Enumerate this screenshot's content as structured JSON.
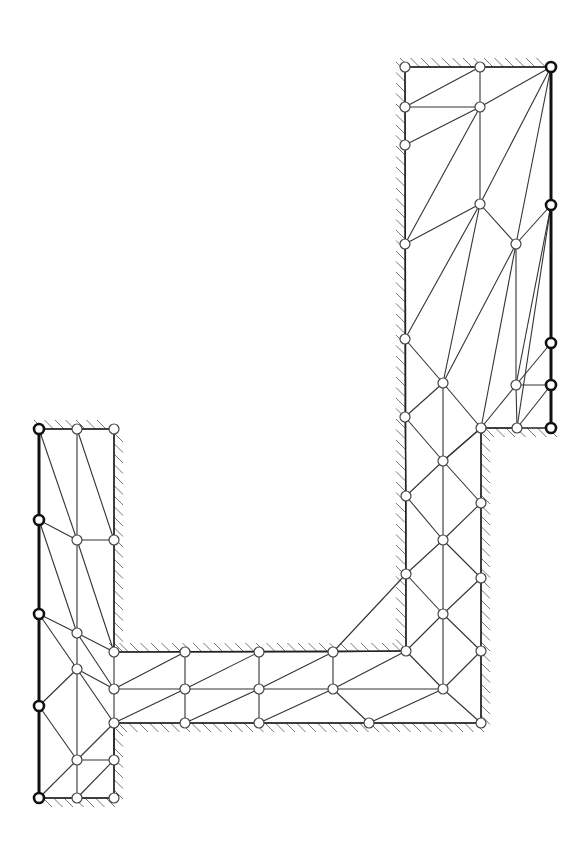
{
  "diagram": {
    "title": "",
    "type": "finite-element-mesh",
    "colors": {
      "line": "#333333",
      "hatch": "#777777",
      "background": "#ffffff"
    },
    "node_radius": 5,
    "nodes": [
      {
        "id": "A1",
        "x": 405,
        "y": 67
      },
      {
        "id": "A2",
        "x": 480,
        "y": 67
      },
      {
        "id": "A3",
        "x": 551,
        "y": 67,
        "fixed": true
      },
      {
        "id": "A4",
        "x": 405,
        "y": 107
      },
      {
        "id": "A5",
        "x": 480,
        "y": 107
      },
      {
        "id": "A6",
        "x": 405,
        "y": 145
      },
      {
        "id": "A7",
        "x": 480,
        "y": 204
      },
      {
        "id": "A8",
        "x": 551,
        "y": 205,
        "fixed": true
      },
      {
        "id": "A9",
        "x": 405,
        "y": 244
      },
      {
        "id": "A10",
        "x": 516,
        "y": 244
      },
      {
        "id": "A11",
        "x": 405,
        "y": 339
      },
      {
        "id": "A12",
        "x": 551,
        "y": 343,
        "fixed": true
      },
      {
        "id": "A13",
        "x": 443,
        "y": 383
      },
      {
        "id": "A14",
        "x": 516,
        "y": 385
      },
      {
        "id": "A15",
        "x": 551,
        "y": 385,
        "fixed": true
      },
      {
        "id": "A16",
        "x": 405,
        "y": 417
      },
      {
        "id": "A17",
        "x": 481,
        "y": 428
      },
      {
        "id": "A18",
        "x": 517,
        "y": 428
      },
      {
        "id": "A19",
        "x": 551,
        "y": 428,
        "fixed": true
      },
      {
        "id": "A20",
        "x": 443,
        "y": 461
      },
      {
        "id": "A21",
        "x": 406,
        "y": 496
      },
      {
        "id": "A22",
        "x": 481,
        "y": 503
      },
      {
        "id": "A23",
        "x": 443,
        "y": 540
      },
      {
        "id": "A24",
        "x": 406,
        "y": 574
      },
      {
        "id": "A25",
        "x": 481,
        "y": 578
      },
      {
        "id": "A26",
        "x": 443,
        "y": 614
      },
      {
        "id": "A27",
        "x": 406,
        "y": 651
      },
      {
        "id": "A28",
        "x": 481,
        "y": 651
      },
      {
        "id": "A29",
        "x": 443,
        "y": 689
      },
      {
        "id": "A30",
        "x": 481,
        "y": 723
      },
      {
        "id": "B1",
        "x": 114,
        "y": 652
      },
      {
        "id": "B2",
        "x": 185,
        "y": 652
      },
      {
        "id": "B3",
        "x": 259,
        "y": 652
      },
      {
        "id": "B4",
        "x": 333,
        "y": 652
      },
      {
        "id": "B5",
        "x": 114,
        "y": 689
      },
      {
        "id": "B6",
        "x": 185,
        "y": 689
      },
      {
        "id": "B7",
        "x": 259,
        "y": 689
      },
      {
        "id": "B8",
        "x": 333,
        "y": 689
      },
      {
        "id": "B9",
        "x": 114,
        "y": 723
      },
      {
        "id": "B10",
        "x": 185,
        "y": 723
      },
      {
        "id": "B11",
        "x": 259,
        "y": 723
      },
      {
        "id": "B12",
        "x": 369,
        "y": 723
      },
      {
        "id": "C1",
        "x": 39,
        "y": 429,
        "fixed": true
      },
      {
        "id": "C2",
        "x": 77,
        "y": 429
      },
      {
        "id": "C3",
        "x": 114,
        "y": 429
      },
      {
        "id": "C4",
        "x": 39,
        "y": 520,
        "fixed": true
      },
      {
        "id": "C5",
        "x": 77,
        "y": 540
      },
      {
        "id": "C6",
        "x": 114,
        "y": 540
      },
      {
        "id": "C7",
        "x": 39,
        "y": 614,
        "fixed": true
      },
      {
        "id": "C8",
        "x": 77,
        "y": 633
      },
      {
        "id": "C9",
        "x": 77,
        "y": 669
      },
      {
        "id": "C10",
        "x": 39,
        "y": 706,
        "fixed": true
      },
      {
        "id": "C11",
        "x": 77,
        "y": 760
      },
      {
        "id": "C12",
        "x": 114,
        "y": 760
      },
      {
        "id": "C13",
        "x": 39,
        "y": 798,
        "fixed": true
      },
      {
        "id": "C14",
        "x": 77,
        "y": 798
      },
      {
        "id": "C15",
        "x": 114,
        "y": 798
      }
    ],
    "edges": [
      [
        "A1",
        "A2"
      ],
      [
        "A2",
        "A3"
      ],
      [
        "A1",
        "A4"
      ],
      [
        "A2",
        "A5"
      ],
      [
        "A4",
        "A5"
      ],
      [
        "A4",
        "A2"
      ],
      [
        "A5",
        "A3"
      ],
      [
        "A4",
        "A6"
      ],
      [
        "A6",
        "A5"
      ],
      [
        "A5",
        "A7"
      ],
      [
        "A5",
        "A9"
      ],
      [
        "A6",
        "A9"
      ],
      [
        "A3",
        "A7"
      ],
      [
        "A3",
        "A10"
      ],
      [
        "A7",
        "A9"
      ],
      [
        "A7",
        "A10"
      ],
      [
        "A10",
        "A8"
      ],
      [
        "A9",
        "A11"
      ],
      [
        "A7",
        "A11"
      ],
      [
        "A7",
        "A13"
      ],
      [
        "A10",
        "A13"
      ],
      [
        "A10",
        "A14"
      ],
      [
        "A10",
        "A17"
      ],
      [
        "A8",
        "A14"
      ],
      [
        "A8",
        "A18"
      ],
      [
        "A11",
        "A13"
      ],
      [
        "A11",
        "A16"
      ],
      [
        "A13",
        "A16"
      ],
      [
        "A13",
        "A17"
      ],
      [
        "A14",
        "A17"
      ],
      [
        "A14",
        "A12"
      ],
      [
        "A14",
        "A15"
      ],
      [
        "A14",
        "A18"
      ],
      [
        "A18",
        "A15"
      ],
      [
        "A17",
        "A18"
      ],
      [
        "A16",
        "A20"
      ],
      [
        "A17",
        "A20"
      ],
      [
        "A16",
        "A21"
      ],
      [
        "A20",
        "A21"
      ],
      [
        "A20",
        "A17"
      ],
      [
        "A13",
        "A20"
      ],
      [
        "A20",
        "A22"
      ],
      [
        "A21",
        "A23"
      ],
      [
        "A22",
        "A23"
      ],
      [
        "A17",
        "A22"
      ],
      [
        "A20",
        "A23"
      ],
      [
        "A21",
        "A24"
      ],
      [
        "A23",
        "A24"
      ],
      [
        "A22",
        "A25"
      ],
      [
        "A23",
        "A25"
      ],
      [
        "A24",
        "A26"
      ],
      [
        "A25",
        "A26"
      ],
      [
        "A23",
        "A26"
      ],
      [
        "A24",
        "A27"
      ],
      [
        "A26",
        "A27"
      ],
      [
        "A26",
        "A28"
      ],
      [
        "A25",
        "A28"
      ],
      [
        "A26",
        "A29"
      ],
      [
        "A27",
        "A29"
      ],
      [
        "A28",
        "A29"
      ],
      [
        "A28",
        "A30"
      ],
      [
        "A29",
        "A30"
      ],
      [
        "A29",
        "A12x"
      ],
      [
        "A27",
        "B4"
      ],
      [
        "A24",
        "B4"
      ],
      [
        "B1",
        "B2"
      ],
      [
        "B2",
        "B3"
      ],
      [
        "B3",
        "B4"
      ],
      [
        "B1",
        "B5"
      ],
      [
        "B2",
        "B6"
      ],
      [
        "B3",
        "B7"
      ],
      [
        "B4",
        "B8"
      ],
      [
        "B5",
        "B2"
      ],
      [
        "B6",
        "B3"
      ],
      [
        "B7",
        "B4"
      ],
      [
        "B8",
        "A27"
      ],
      [
        "B5",
        "B6"
      ],
      [
        "B6",
        "B7"
      ],
      [
        "B7",
        "B8"
      ],
      [
        "B8",
        "A29"
      ],
      [
        "B5",
        "B9"
      ],
      [
        "B6",
        "B10"
      ],
      [
        "B7",
        "B11"
      ],
      [
        "B9",
        "B6"
      ],
      [
        "B10",
        "B7"
      ],
      [
        "B11",
        "B8"
      ],
      [
        "B12",
        "A29"
      ],
      [
        "B9",
        "B10"
      ],
      [
        "B10",
        "B11"
      ],
      [
        "B11",
        "B12"
      ],
      [
        "B12",
        "A30"
      ],
      [
        "B8",
        "B12"
      ],
      [
        "C1",
        "C2"
      ],
      [
        "C2",
        "C3"
      ],
      [
        "C1",
        "C5"
      ],
      [
        "C2",
        "C5"
      ],
      [
        "C2",
        "C6"
      ],
      [
        "C3",
        "C6"
      ],
      [
        "C5",
        "C6"
      ],
      [
        "C4",
        "C5"
      ],
      [
        "C4",
        "C8"
      ],
      [
        "C5",
        "C8"
      ],
      [
        "C5",
        "B1"
      ],
      [
        "C6",
        "B1"
      ],
      [
        "C7",
        "C8"
      ],
      [
        "C7",
        "C9"
      ],
      [
        "C8",
        "C9"
      ],
      [
        "C8",
        "B1"
      ],
      [
        "C8",
        "B5"
      ],
      [
        "C9",
        "B5"
      ],
      [
        "C9",
        "C10"
      ],
      [
        "C9",
        "B9"
      ],
      [
        "C9",
        "C11"
      ],
      [
        "B9",
        "C12"
      ],
      [
        "C10",
        "C11"
      ],
      [
        "C11",
        "C12"
      ],
      [
        "C11",
        "B9"
      ],
      [
        "C12",
        "B9"
      ],
      [
        "C13",
        "C11"
      ],
      [
        "C11",
        "C14"
      ],
      [
        "C12",
        "C15"
      ],
      [
        "C14",
        "C15"
      ],
      [
        "C12",
        "C14"
      ],
      [
        "C13",
        "C14"
      ]
    ],
    "bold_edges": [
      [
        "A3",
        "A8"
      ],
      [
        "A8",
        "A12"
      ],
      [
        "A12",
        "A15"
      ],
      [
        "A15",
        "A19"
      ],
      [
        "C1",
        "C4"
      ],
      [
        "C4",
        "C7"
      ],
      [
        "C7",
        "C10"
      ],
      [
        "C10",
        "C13"
      ]
    ],
    "boundary": [
      [
        "A1",
        "A3"
      ],
      [
        "A1",
        "A27"
      ],
      [
        "A19",
        "A17"
      ],
      [
        "A17",
        "A30"
      ],
      [
        "A30",
        "B9"
      ],
      [
        "B1",
        "A27"
      ],
      [
        "B1",
        "C3"
      ],
      [
        "C1",
        "C3"
      ],
      [
        "C13",
        "C15"
      ],
      [
        "C15",
        "B9"
      ]
    ],
    "hatched_walls": [
      {
        "name": "top-right-wall",
        "x1": 405,
        "y1": 67,
        "x2": 551,
        "y2": 67,
        "side": "up"
      },
      {
        "name": "right-column-left-wall",
        "x1": 405,
        "y1": 67,
        "x2": 405,
        "y2": 651,
        "side": "left"
      },
      {
        "name": "step-bottom-wall",
        "x1": 481,
        "y1": 428,
        "x2": 551,
        "y2": 428,
        "side": "down"
      },
      {
        "name": "right-column-right-wall",
        "x1": 481,
        "y1": 428,
        "x2": 481,
        "y2": 723,
        "side": "right"
      },
      {
        "name": "channel-bottom-wall",
        "x1": 114,
        "y1": 723,
        "x2": 481,
        "y2": 723,
        "side": "down"
      },
      {
        "name": "channel-top-wall",
        "x1": 114,
        "y1": 652,
        "x2": 405,
        "y2": 652,
        "side": "up"
      },
      {
        "name": "left-column-right-wall",
        "x1": 114,
        "y1": 429,
        "x2": 114,
        "y2": 652,
        "side": "right"
      },
      {
        "name": "left-top-wall",
        "x1": 39,
        "y1": 429,
        "x2": 114,
        "y2": 429,
        "side": "up"
      },
      {
        "name": "left-lower-right-wall",
        "x1": 114,
        "y1": 723,
        "x2": 114,
        "y2": 798,
        "side": "right"
      },
      {
        "name": "left-bottom-wall",
        "x1": 39,
        "y1": 798,
        "x2": 114,
        "y2": 798,
        "side": "down"
      }
    ]
  }
}
